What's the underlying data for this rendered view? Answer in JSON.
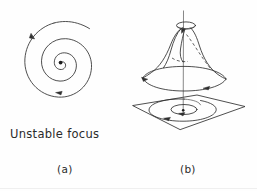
{
  "figure": {
    "width": 257,
    "height": 191,
    "background_color": "#fefefe",
    "ink_color": "#2f2f2f",
    "caption_color": "#2b2b2b"
  },
  "labels": {
    "unstable_focus": "Unstable focus",
    "panel_a": "(a)",
    "panel_b": "(b)"
  },
  "panel_a": {
    "name": "unstable-focus-spiral",
    "description_icon": "spiral-icon",
    "center_dot": {
      "x": 60,
      "y": 63
    },
    "arrow_names": [
      "spiral-outward-arrow-upper-left",
      "spiral-inward-arrow-lower"
    ]
  },
  "panel_b": {
    "name": "hopf-bifurcation-trumpet",
    "surface_icon": "trumpet-surface-icon",
    "base_plane_icon": "parallelogram-plane-icon",
    "axis_icon": "vertical-axis-icon",
    "hidden_edge_style": "dashed",
    "arrow_names": [
      "cone-rim-arrow-left",
      "cone-rim-arrow-right",
      "cone-top-arrow",
      "plane-spiral-arrow-bottom",
      "plane-inner-arrow"
    ]
  }
}
